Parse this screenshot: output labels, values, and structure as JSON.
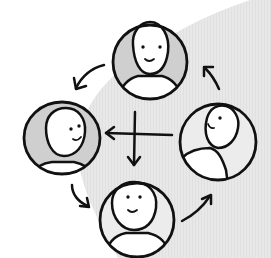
{
  "figure": {
    "colors": {
      "background": "#ffffff",
      "wedge": "#e6e6e6",
      "stroke": "#111111",
      "avatar_fill_dark": "#cfcfcf",
      "avatar_fill_light": "#ececec",
      "skin": "#ffffff"
    }
  },
  "avatars": [
    {
      "id": "top",
      "name": "person-top",
      "facing": "front"
    },
    {
      "id": "left",
      "name": "person-left",
      "facing": "right"
    },
    {
      "id": "right",
      "name": "person-right",
      "facing": "left"
    },
    {
      "id": "bottom",
      "name": "person-bottom",
      "facing": "front"
    }
  ],
  "arrows": [
    {
      "from": "top",
      "to": "left",
      "direction": "counterclockwise"
    },
    {
      "from": "left",
      "to": "bottom",
      "direction": "counterclockwise"
    },
    {
      "from": "bottom",
      "to": "right",
      "direction": "counterclockwise"
    },
    {
      "from": "right",
      "to": "top",
      "direction": "counterclockwise"
    },
    {
      "from": "right",
      "to": "left",
      "type": "center-horizontal"
    },
    {
      "from": "top",
      "to": "bottom",
      "type": "center-vertical"
    }
  ]
}
